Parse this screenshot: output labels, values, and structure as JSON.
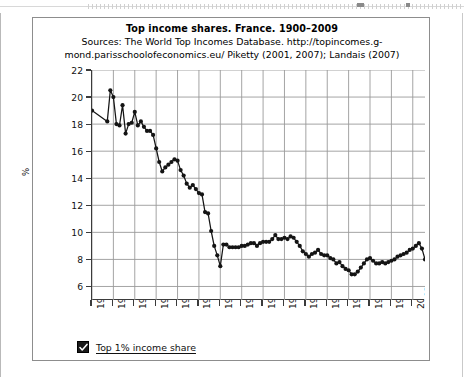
{
  "document": {
    "ruler": {
      "name": "horizontal-ruler",
      "tab_stops": 3
    }
  },
  "figure": {
    "title": "Top income shares. France. 1900–2009",
    "sources": "Sources: The World Top Incomes Database. http://topincomes.g-mond.parisschoolofeconomics.eu/ Piketty (2001, 2007); Landais (2007)",
    "legend": {
      "checkbox_checked": true,
      "label": "Top 1% income share"
    }
  },
  "colors": {
    "series": "#141414",
    "grid": "#9a9a9a",
    "axis": "#3b3b3b",
    "frame": "#8d8d8d",
    "background": "#ffffff"
  },
  "chart_data": {
    "type": "line",
    "title": "Top income shares. France. 1900–2009",
    "subtitle": "Sources: The World Top Incomes Database. http://topincomes.g-mond.parisschoolofeconomics.eu/ Piketty (2001, 2007); Landais (2007)",
    "xlabel": "",
    "ylabel": "%",
    "xlim": [
      1900,
      2009
    ],
    "ylim": [
      5,
      22
    ],
    "grid": true,
    "legend_position": "bottom-left",
    "marker": "circle",
    "y_ticks": [
      6,
      8,
      10,
      12,
      14,
      16,
      18,
      20,
      22
    ],
    "x_ticks": [
      1900,
      1907,
      1914,
      1921,
      1928,
      1935,
      1942,
      1949,
      1956,
      1963,
      1970,
      1977,
      1984,
      1991,
      1998,
      2005
    ],
    "series": [
      {
        "name": "Top 1% income share",
        "x": [
          1900,
          1905,
          1906,
          1907,
          1908,
          1909,
          1910,
          1911,
          1912,
          1913,
          1914,
          1915,
          1916,
          1917,
          1918,
          1919,
          1920,
          1921,
          1922,
          1923,
          1924,
          1925,
          1926,
          1927,
          1928,
          1929,
          1930,
          1931,
          1932,
          1933,
          1934,
          1935,
          1936,
          1937,
          1938,
          1939,
          1940,
          1941,
          1942,
          1943,
          1944,
          1945,
          1946,
          1947,
          1948,
          1949,
          1950,
          1951,
          1952,
          1953,
          1954,
          1955,
          1956,
          1957,
          1958,
          1959,
          1960,
          1961,
          1962,
          1963,
          1964,
          1965,
          1966,
          1967,
          1968,
          1969,
          1970,
          1971,
          1972,
          1973,
          1974,
          1975,
          1976,
          1977,
          1978,
          1979,
          1980,
          1981,
          1982,
          1983,
          1984,
          1985,
          1986,
          1987,
          1988,
          1989,
          1990,
          1991,
          1992,
          1993,
          1994,
          1995,
          1996,
          1997,
          1998,
          1999,
          2000,
          2001,
          2002,
          2003,
          2004,
          2005,
          2006,
          2007,
          2008,
          2009
        ],
        "y": [
          19.0,
          18.2,
          20.5,
          20.0,
          18.0,
          17.9,
          19.4,
          17.3,
          18.0,
          18.1,
          18.9,
          17.9,
          18.2,
          17.8,
          17.5,
          17.5,
          17.2,
          16.2,
          15.2,
          14.5,
          14.8,
          15.0,
          15.2,
          15.4,
          15.3,
          14.6,
          14.2,
          13.6,
          13.3,
          13.5,
          13.2,
          12.9,
          12.8,
          11.5,
          11.4,
          10.1,
          9.0,
          8.3,
          7.5,
          9.1,
          9.1,
          8.9,
          8.9,
          8.9,
          8.9,
          9.0,
          9.0,
          9.1,
          9.2,
          9.2,
          9.0,
          9.2,
          9.3,
          9.3,
          9.3,
          9.5,
          9.8,
          9.5,
          9.5,
          9.6,
          9.5,
          9.7,
          9.6,
          9.3,
          9.0,
          8.6,
          8.4,
          8.2,
          8.4,
          8.5,
          8.7,
          8.4,
          8.3,
          8.3,
          8.1,
          8.0,
          7.7,
          7.8,
          7.5,
          7.3,
          7.2,
          6.9,
          6.9,
          7.1,
          7.4,
          7.7,
          8.0,
          8.1,
          7.9,
          7.7,
          7.7,
          7.8,
          7.7,
          7.8,
          7.9,
          8.0,
          8.2,
          8.3,
          8.4,
          8.5,
          8.7,
          8.8,
          9.0,
          9.2,
          8.8,
          8.0
        ]
      }
    ]
  }
}
